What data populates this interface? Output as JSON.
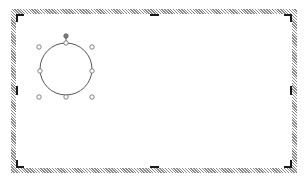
{
  "canvas": {
    "type": "drawing-canvas",
    "frame_color": "#8a8a8a",
    "handle_color": "#1a1a1a",
    "bounds": {
      "left": 11,
      "top": 9,
      "right": 297,
      "bottom": 173
    }
  },
  "shape": {
    "type": "circle",
    "center": {
      "x": 66,
      "y": 68
    },
    "radius": 26,
    "stroke": "#555555",
    "selected": true,
    "selection_box": {
      "left": 39,
      "top": 47,
      "right": 92,
      "bottom": 97
    },
    "rotation_handle": {
      "x": 66,
      "y": 36,
      "color": "#808080"
    }
  }
}
